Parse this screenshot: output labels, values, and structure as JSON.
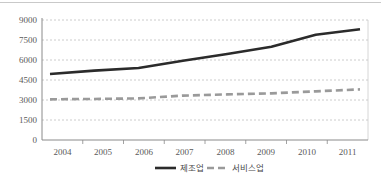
{
  "chart_data": {
    "type": "line",
    "title": "",
    "subtitle": "",
    "xlabel": "",
    "ylabel": "",
    "categories": [
      "2004",
      "2005",
      "2006",
      "2007",
      "2008",
      "2009",
      "2010",
      "2011"
    ],
    "x": [
      2004,
      2005,
      2006,
      2007,
      2008,
      2009,
      2010,
      2011
    ],
    "series": [
      {
        "name": "제조업",
        "style": "solid",
        "color": "#2b2b2b",
        "values": [
          4950,
          5200,
          5400,
          5950,
          6450,
          7000,
          7900,
          8300
        ]
      },
      {
        "name": "서비스업",
        "style": "dashed",
        "color": "#9a9a9a",
        "values": [
          3050,
          3080,
          3120,
          3330,
          3420,
          3500,
          3650,
          3800
        ]
      }
    ],
    "yticks": [
      0,
      1500,
      3000,
      4500,
      6000,
      7500,
      9000
    ],
    "ytick_labels": [
      "0",
      "1500",
      "3000",
      "4500",
      "6000",
      "7500",
      "9000"
    ],
    "ylim": [
      0,
      9000
    ],
    "grid": true,
    "grid_axis": "y",
    "grid_style": "dotted",
    "legend_position": "bottom",
    "legend": [
      "제조업",
      "서비스업"
    ],
    "plot_border": true
  },
  "axis": {
    "y_labels": [
      "9000",
      "7500",
      "6000",
      "4500",
      "3000",
      "1500",
      "0"
    ],
    "x_labels": [
      "2004",
      "2005",
      "2006",
      "2007",
      "2008",
      "2009",
      "2010",
      "2011"
    ]
  },
  "legend": {
    "items": [
      {
        "label": "제조업",
        "color": "#2b2b2b",
        "style": "solid"
      },
      {
        "label": "서비스업",
        "color": "#9a9a9a",
        "style": "dashed"
      }
    ]
  },
  "colors": {
    "series_manufacturing": "#2b2b2b",
    "series_service": "#9a9a9a",
    "grid": "#bfbfbf",
    "axis": "#808080",
    "text": "#5a5a5a",
    "background": "#ffffff"
  }
}
